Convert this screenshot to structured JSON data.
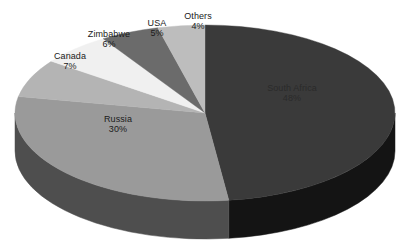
{
  "chart_data": {
    "type": "pie",
    "title": "",
    "subtitle": "",
    "xlabel": "",
    "ylabel": "",
    "legend_position": "none",
    "grid": false,
    "unit": "%",
    "categories": [
      "South Africa",
      "Russia",
      "Canada",
      "Zimbabwe",
      "USA",
      "Others"
    ],
    "values": [
      48,
      30,
      7,
      6,
      5,
      4
    ],
    "slices": [
      {
        "name": "South Africa",
        "value": 48,
        "label": "South Africa",
        "percent_label": "48%",
        "color": "#3a3a3a",
        "side_color": "#141414"
      },
      {
        "name": "Russia",
        "value": 30,
        "label": "Russia",
        "percent_label": "30%",
        "color": "#9a9a9a",
        "side_color": "#4e4e4e"
      },
      {
        "name": "Canada",
        "value": 7,
        "label": "Canada",
        "percent_label": "7%",
        "color": "#b4b4b4",
        "side_color": "#5e5e5e"
      },
      {
        "name": "Zimbabwe",
        "value": 6,
        "label": "Zimbabwe",
        "percent_label": "6%",
        "color": "#f0f0f0",
        "side_color": "#8a8a8a"
      },
      {
        "name": "USA",
        "value": 5,
        "label": "USA",
        "percent_label": "5%",
        "color": "#6b6b6b",
        "side_color": "#3a3a3a"
      },
      {
        "name": "Others",
        "value": 4,
        "label": "Others",
        "percent_label": "4%",
        "color": "#bdbdbd",
        "side_color": "#646464"
      }
    ],
    "annotations": []
  },
  "colors": {
    "background": "#ffffff",
    "label_text": "#111111",
    "south_africa": "#3a3a3a",
    "russia": "#9a9a9a",
    "canada": "#b4b4b4",
    "zimbabwe": "#f0f0f0",
    "usa": "#6b6b6b",
    "others": "#bdbdbd"
  }
}
